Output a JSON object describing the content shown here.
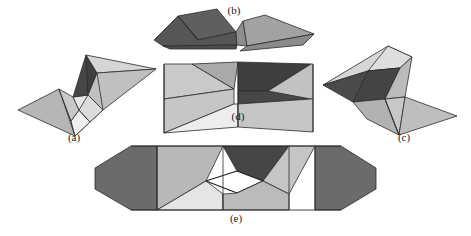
{
  "figure": {
    "width": 471,
    "height": 236,
    "background_color": "#ffffff",
    "stroke_color": "#2b2b2b",
    "label_color": "#1a1a1a"
  },
  "palette": {
    "white": "#ffffff",
    "very_light_gray": "#e8e8e8",
    "light_gray": "#d0d0d0",
    "mid_light_gray": "#bdbdbd",
    "mid_gray": "#a8a8a8",
    "gray": "#949494",
    "dark_gray": "#6e6e6e",
    "darker_gray": "#5a5a5a",
    "very_dark_gray": "#454545",
    "near_black": "#3a3a3a"
  },
  "panels": [
    {
      "id": "a",
      "label": "(a)",
      "label_x": 74,
      "label_y": 139,
      "description": "Left partially folded form, two wings meeting at a central pinch"
    },
    {
      "id": "b",
      "label": "(b)",
      "label_x": 234,
      "label_y": 7,
      "description": "Top nearly flat folded strip seen edge-on"
    },
    {
      "id": "c",
      "label": "(c)",
      "label_x": 404,
      "label_y": 139,
      "description": "Right partially folded form, mirror of panel a"
    },
    {
      "id": "d",
      "label": "(d)",
      "label_x": 238,
      "label_y": 116,
      "description": "Center bowtie / hourglass intermediate state"
    },
    {
      "id": "e",
      "label": "(e)",
      "label_x": 236,
      "label_y": 218,
      "description": "Bottom fully unfolded wide form with white diamond aperture"
    }
  ],
  "shapes": {
    "a": [
      {
        "name": "a-wing-lower-left",
        "points": "19,110 58,90 88,121 74,134",
        "fill": "#b8b8b8"
      },
      {
        "name": "a-lower-left-inner",
        "points": "58,90 88,121 74,134 72,131",
        "fill": "#b0b0b0"
      },
      {
        "name": "a-lower-mid-light",
        "points": "72,99 88,121 74,134 70,122",
        "fill": "#ededed"
      },
      {
        "name": "a-lower-mid-pale",
        "points": "58,90 72,99 70,122 88,121",
        "fill": "#c4c4c4"
      },
      {
        "name": "a-center-pale",
        "points": "72,99 86,94 101,110 88,121",
        "fill": "#eaeaea"
      },
      {
        "name": "a-center-wedge",
        "points": "86,94 101,110 88,121 96,127",
        "fill": "#dcdcdc"
      },
      {
        "name": "a-upper-dark",
        "points": "72,99 86,56 96,74 86,94",
        "fill": "#4a4a4a"
      },
      {
        "name": "a-upper-dark2",
        "points": "86,56 96,74 86,94 72,99",
        "fill": "#484848"
      },
      {
        "name": "a-upper-light",
        "points": "86,56 155,70 96,74",
        "fill": "#d4d4d4"
      },
      {
        "name": "a-upper-mid",
        "points": "96,74 155,70 101,110 86,94",
        "fill": "#c2c2c2"
      },
      {
        "name": "a-upper-right",
        "points": "155,70 101,110 96,103",
        "fill": "#c8c8c8"
      }
    ],
    "b": [
      {
        "name": "b-left-top-dark",
        "points": "179,16 216,10 232,30 196,40",
        "fill": "#5c5c5c"
      },
      {
        "name": "b-left-face-dark",
        "points": "153,40 179,16 196,40 232,30 234,45 160,44",
        "fill": "#5a5a5a"
      },
      {
        "name": "b-left-upper-strip",
        "points": "179,16 216,10 232,30 196,40",
        "fill": "#585858"
      },
      {
        "name": "b-left-shadow",
        "points": "153,40 196,40 234,45 160,45",
        "fill": "#4f4f4f"
      },
      {
        "name": "b-center-notch",
        "points": "232,30 240,22 244,46 234,45",
        "fill": "#909090"
      },
      {
        "name": "b-right-light",
        "points": "240,22 262,16 312,35 244,46",
        "fill": "#a0a0a0"
      },
      {
        "name": "b-right-lower",
        "points": "244,46 312,35 300,44 238,50",
        "fill": "#8d8d8d"
      },
      {
        "name": "b-right-edge",
        "points": "262,16 312,35 300,20",
        "fill": "#9a9a9a"
      }
    ],
    "c": [
      {
        "name": "c-upper-light-top",
        "points": "387,47 410,58 367,71 324,85",
        "fill": "#d4d4d4"
      },
      {
        "name": "c-upper-pale",
        "points": "387,47 410,58 398,68 367,71",
        "fill": "#dddddd"
      },
      {
        "name": "c-upper-dark",
        "points": "324,85 367,71 398,68 383,98 352,101",
        "fill": "#4c4c4c"
      },
      {
        "name": "c-upper-dark2",
        "points": "324,85 352,101 383,98 398,68",
        "fill": "#4a4a4a"
      },
      {
        "name": "c-mid-pinch",
        "points": "383,98 398,68 410,58 403,97",
        "fill": "#b9b9b9"
      },
      {
        "name": "c-lower-left",
        "points": "352,101 383,98 397,134 365,118",
        "fill": "#b4b4b4"
      },
      {
        "name": "c-lower-mid",
        "points": "383,98 403,97 397,134",
        "fill": "#c6c6c6"
      },
      {
        "name": "c-lower-right",
        "points": "403,97 455,115 397,134",
        "fill": "#bfbfbf"
      },
      {
        "name": "c-lower-right2",
        "points": "383,98 403,97 455,115 397,134",
        "fill": "#bcbcbc"
      }
    ],
    "d": [
      {
        "name": "d-left-outer-top",
        "points": "165,65 165,98 232,88 190,65",
        "fill": "#c9c9c9"
      },
      {
        "name": "d-left-top-mid",
        "points": "190,65 232,88 237,63",
        "fill": "#a9a9a9"
      },
      {
        "name": "d-left-top-upper",
        "points": "165,65 190,65 237,63 232,88",
        "fill": "#b2b2b2"
      },
      {
        "name": "d-left-outer-lower",
        "points": "165,98 165,132 232,104 232,88",
        "fill": "#c9c9c9"
      },
      {
        "name": "d-left-bottom-pale",
        "points": "232,88 232,104 237,126 165,132",
        "fill": "#ececec"
      },
      {
        "name": "d-left-bottom-pale2",
        "points": "165,132 237,126 237,104 232,104",
        "fill": "#e6e6e6"
      },
      {
        "name": "d-center-dark",
        "points": "237,63 310,65 267,90 237,90",
        "fill": "#3f3f3f"
      },
      {
        "name": "d-center-dark2",
        "points": "237,63 237,90 267,90 310,65",
        "fill": "#3d3d3d"
      },
      {
        "name": "d-center-band",
        "points": "237,90 310,65 310,98 237,104",
        "fill": "#4a4a4a"
      },
      {
        "name": "d-right-upper",
        "points": "310,65 310,98 267,90",
        "fill": "#bdbdbd"
      },
      {
        "name": "d-right-outer-top",
        "points": "310,65 310,98 270,96 310,65",
        "fill": "#c4c4c4"
      },
      {
        "name": "d-right-mid",
        "points": "237,104 310,98 310,131 237,126",
        "fill": "#c4c4c4"
      },
      {
        "name": "d-right-wing-upper",
        "points": "310,65 312,65 312,131 310,98",
        "fill": "#cacaca"
      },
      {
        "name": "d-right-wing",
        "points": "267,90 310,65 312,65 312,131 310,131 310,98",
        "fill": "#c6c6c6"
      }
    ],
    "e": [
      {
        "name": "e-left-dark-wing",
        "points": "96,169 130,146 156,146 156,209 130,209",
        "fill": "#6a6a6a"
      },
      {
        "name": "e-left-dark-wing2",
        "points": "96,169 96,188 130,209 156,209 156,146 130,146",
        "fill": "#686868"
      },
      {
        "name": "e-left-mid-upper",
        "points": "156,146 222,146 205,180 156,209",
        "fill": "#b9b9b9"
      },
      {
        "name": "e-left-upper-triangle",
        "points": "156,146 222,146 205,180",
        "fill": "#b0b0b0"
      },
      {
        "name": "e-left-lower-pale",
        "points": "156,209 205,180 222,193 222,209",
        "fill": "#e4e4e4"
      },
      {
        "name": "e-left-lower-pale2",
        "points": "156,209 205,180 222,193 222,209",
        "fill": "#e2e2e2"
      },
      {
        "name": "e-center-dark",
        "points": "222,146 288,146 262,180 236,170",
        "fill": "#464646"
      },
      {
        "name": "e-center-white-hole",
        "points": "205,180 236,170 262,180 236,192",
        "fill": "#ffffff"
      },
      {
        "name": "e-right-upper-light",
        "points": "288,146 262,180 288,193 288,146",
        "fill": "#c8c8c8"
      },
      {
        "name": "e-right-upper-light2",
        "points": "262,180 288,146 314,146 288,193",
        "fill": "#c4c4c4"
      },
      {
        "name": "e-right-lower",
        "points": "222,193 236,192 262,180 288,193 288,209 222,209",
        "fill": "#bcbcbc"
      },
      {
        "name": "e-right-lower2",
        "points": "236,192 262,180 288,193 288,209 222,209 222,193",
        "fill": "#bababa"
      },
      {
        "name": "e-right-dark-wing",
        "points": "314,146 340,146 375,169 375,188 340,209 314,209",
        "fill": "#6a6a6a"
      },
      {
        "name": "e-right-dark-wing2",
        "points": "314,146 340,146 375,169 375,188 340,209 314,209",
        "fill": "#686868"
      }
    ]
  }
}
